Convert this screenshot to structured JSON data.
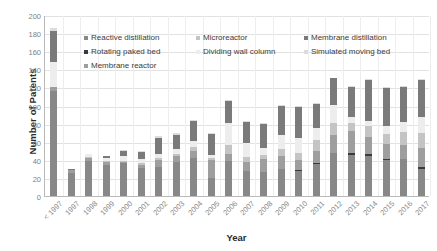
{
  "chart_data": {
    "type": "bar",
    "stacked": true,
    "title": "",
    "xlabel": "Year",
    "ylabel": "Number of Patents",
    "ylim": [
      0,
      200
    ],
    "ytick_step": 20,
    "yticks": [
      0,
      20,
      40,
      60,
      80,
      100,
      120,
      140,
      160,
      180,
      200
    ],
    "grid": true,
    "legend_position": "upper-center-inside",
    "categories": [
      "< 1997",
      "1997",
      "1998",
      "1999",
      "2000",
      "2001",
      "2002",
      "2003",
      "2004",
      "2005",
      "2006",
      "2007",
      "2008",
      "2009",
      "2010",
      "2011",
      "2012",
      "2013",
      "2014",
      "2015",
      "2016",
      "2017"
    ],
    "series": [
      {
        "name": "Reactive distillation",
        "color": "#888888",
        "values": [
          116,
          25,
          39,
          34,
          36,
          31,
          32,
          38,
          42,
          20,
          39,
          28,
          26,
          30,
          28,
          35,
          48,
          45,
          44,
          40,
          41,
          30
        ]
      },
      {
        "name": "Rotating paked bed",
        "color": "#3a3a3a",
        "values": [
          0,
          0,
          0,
          0,
          0,
          0,
          0,
          0,
          0,
          0,
          0,
          0,
          0,
          0,
          1,
          1,
          0,
          2,
          2,
          1,
          0,
          2
        ]
      },
      {
        "name": "Membrane reactor",
        "color": "#9e9e9e",
        "values": [
          4,
          4,
          3,
          4,
          2,
          3,
          8,
          6,
          8,
          20,
          7,
          10,
          15,
          14,
          11,
          14,
          19,
          25,
          19,
          17,
          15,
          21
        ]
      },
      {
        "name": "Microreactor",
        "color": "#c4c4c4",
        "values": [
          0,
          0,
          1,
          1,
          1,
          2,
          2,
          3,
          4,
          2,
          10,
          5,
          4,
          8,
          8,
          12,
          14,
          9,
          12,
          11,
          15,
          17
        ]
      },
      {
        "name": "Dividing wall column",
        "color": "#ededed",
        "values": [
          28,
          0,
          3,
          3,
          5,
          5,
          5,
          5,
          7,
          3,
          25,
          16,
          8,
          16,
          16,
          13,
          20,
          6,
          6,
          8,
          11,
          17
        ]
      },
      {
        "name": "Membrane distillation",
        "color": "#7a7a7a",
        "values": [
          34,
          1,
          1,
          2,
          6,
          8,
          17,
          16,
          22,
          24,
          24,
          23,
          27,
          32,
          34,
          27,
          29,
          34,
          45,
          42,
          39,
          41
        ]
      },
      {
        "name": "Simulated moving bed",
        "color": "#dcdcdc",
        "values": [
          4,
          0,
          0,
          0,
          1,
          1,
          2,
          2,
          1,
          1,
          1,
          1,
          1,
          1,
          1,
          1,
          1,
          1,
          1,
          1,
          1,
          1
        ]
      }
    ],
    "totals": [
      186,
      30,
      47,
      44,
      51,
      50,
      66,
      70,
      84,
      70,
      106,
      83,
      81,
      101,
      99,
      103,
      131,
      122,
      129,
      120,
      122,
      129
    ]
  },
  "legend": {
    "items": [
      {
        "label": "Reactive distillation",
        "color": "#888888"
      },
      {
        "label": "Microreactor",
        "color": "#c4c4c4"
      },
      {
        "label": "Membrane distillation",
        "color": "#7a7a7a"
      },
      {
        "label": "Rotating paked bed",
        "color": "#3a3a3a"
      },
      {
        "label": "Dividing wall column",
        "color": "#ededed"
      },
      {
        "label": "Simulated moving bed",
        "color": "#dcdcdc"
      },
      {
        "label": "Membrane reactor",
        "color": "#9e9e9e"
      }
    ]
  }
}
